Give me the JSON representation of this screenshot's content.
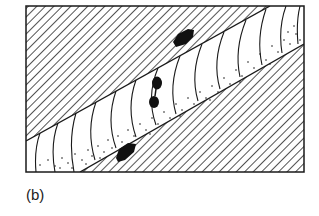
{
  "figure": {
    "caption": "(b)",
    "colors": {
      "ink": "#1a1a1a",
      "background": "#ffffff"
    },
    "regions": [
      {
        "name": "upper-hatched-block",
        "fill": "diagonal-hatch"
      },
      {
        "name": "central-band",
        "fill": "curved-lines-with-stipple"
      },
      {
        "name": "lower-hatched-block",
        "fill": "diagonal-hatch"
      }
    ],
    "inclusions": [
      {
        "name": "upper-black-lens",
        "location": "upper block"
      },
      {
        "name": "band-black-blob-1",
        "location": "central band"
      },
      {
        "name": "band-black-blob-2",
        "location": "central band"
      },
      {
        "name": "lower-black-lens",
        "location": "lower block"
      }
    ]
  }
}
